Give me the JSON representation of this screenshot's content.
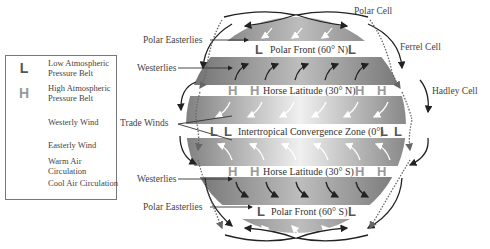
{
  "legend": {
    "items": [
      {
        "symbol": "L",
        "icon": "low-pressure-icon",
        "text": "Low Atmospheric Pressure Belt"
      },
      {
        "symbol": "H",
        "icon": "high-pressure-icon",
        "text": "High Atmospheric Pressure Belt"
      },
      {
        "symbol": "",
        "icon": "westerly-wind-arrow-icon",
        "text": "Westerly Wind"
      },
      {
        "symbol": "",
        "icon": "easterly-wind-arrow-icon",
        "text": "Easterly Wind"
      },
      {
        "symbol": "",
        "icon": "warm-air-circulation-icon",
        "text": "Warm Air Circulation"
      },
      {
        "symbol": "",
        "icon": "cool-air-circulation-icon",
        "text": "Cool Air Circulation"
      }
    ]
  },
  "left_labels": {
    "polar_easterlies_north": "Polar Easterlies",
    "westerlies_north": "Westerlies",
    "trade_winds": "Trade Winds",
    "westerlies_south": "Westerlies",
    "polar_easterlies_south": "Polar Easterlies"
  },
  "right_labels": {
    "polar_cell": "Polar Cell",
    "ferrel_cell": "Ferrel Cell",
    "hadley_cell": "Hadley Cell"
  },
  "bands": {
    "polar_front_north": "Polar Front (60° N)",
    "horse_latitude_north": "Horse Latitude (30° N)",
    "itcz": "Intertropical Convergence Zone (0°)",
    "horse_latitude_south": "Horse Latitude (30° S)",
    "polar_front_south": "Polar Front (60° S)"
  },
  "symbols": {
    "low": "L",
    "high": "H"
  },
  "colors": {
    "band_dark": "#6e6e6e",
    "band_light": "#e8e8e8",
    "low_symbol": "#555555",
    "high_symbol": "#999999",
    "arrow_dark": "#222222"
  }
}
